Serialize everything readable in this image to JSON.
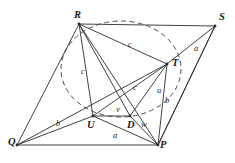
{
  "figure": {
    "type": "geometry-diagram",
    "title": "",
    "stroke_color": "#2b2b2b",
    "dash_color": "#4a4a4a",
    "background": "#ffffff"
  },
  "vertices": [
    {
      "name": "R",
      "label": "R",
      "x": 79,
      "y": 24,
      "lx": 74,
      "ly": 10
    },
    {
      "name": "S",
      "label": "S",
      "x": 215,
      "y": 26,
      "lx": 219,
      "ly": 12
    },
    {
      "name": "T",
      "label": "T",
      "x": 167,
      "y": 64,
      "lx": 172,
      "ly": 58
    },
    {
      "name": "U",
      "label": "U",
      "x": 93,
      "y": 116,
      "lx": 87,
      "ly": 120
    },
    {
      "name": "D",
      "label": "D",
      "x": 130,
      "y": 116,
      "lx": 127,
      "ly": 120
    },
    {
      "name": "Q",
      "label": "Q",
      "x": 17,
      "y": 145,
      "lx": 8,
      "ly": 137
    },
    {
      "name": "P",
      "label": "P",
      "x": 158,
      "y": 145,
      "lx": 160,
      "ly": 140
    }
  ],
  "segments": [
    {
      "name": "R-S",
      "from": "R",
      "to": "S"
    },
    {
      "name": "R-Q",
      "from": "R",
      "to": "Q"
    },
    {
      "name": "Q-P",
      "from": "Q",
      "to": "P"
    },
    {
      "name": "P-S",
      "from": "P",
      "to": "S"
    },
    {
      "name": "R-T",
      "from": "R",
      "to": "T"
    },
    {
      "name": "R-U",
      "from": "R",
      "to": "U"
    },
    {
      "name": "R-D",
      "from": "R",
      "to": "D"
    },
    {
      "name": "R-P",
      "from": "R",
      "to": "P"
    },
    {
      "name": "S-T",
      "from": "S",
      "to": "T"
    },
    {
      "name": "S-P",
      "from": "S",
      "to": "P"
    },
    {
      "name": "T-U",
      "from": "T",
      "to": "U"
    },
    {
      "name": "T-D",
      "from": "T",
      "to": "D"
    },
    {
      "name": "T-P",
      "from": "T",
      "to": "P"
    },
    {
      "name": "U-D",
      "from": "U",
      "to": "D"
    },
    {
      "name": "U-P",
      "from": "U",
      "to": "P"
    },
    {
      "name": "U-Q",
      "from": "U",
      "to": "Q"
    },
    {
      "name": "D-P",
      "from": "D",
      "to": "P"
    },
    {
      "name": "Q-T",
      "from": "Q",
      "to": "T"
    }
  ],
  "segment_labels": [
    {
      "name": "label-c-RT",
      "text": "c",
      "x": 128,
      "y": 40
    },
    {
      "name": "label-a-ST",
      "text": "a",
      "x": 194,
      "y": 44
    },
    {
      "name": "label-c-RU",
      "text": "c",
      "x": 81,
      "y": 67
    },
    {
      "name": "label-c-UT",
      "text": "c",
      "x": 133,
      "y": 83
    },
    {
      "name": "label-u-T",
      "text": "u",
      "x": 157,
      "y": 86
    },
    {
      "name": "label-b-T",
      "text": "b",
      "x": 165,
      "y": 96
    },
    {
      "name": "label-v-UD",
      "text": "v",
      "x": 116,
      "y": 105
    },
    {
      "name": "label-b-QU",
      "text": "b",
      "x": 56,
      "y": 119
    },
    {
      "name": "label-w-DP",
      "text": "w",
      "x": 141,
      "y": 120
    },
    {
      "name": "label-a-UP",
      "text": "a",
      "x": 113,
      "y": 131
    }
  ],
  "circle": {
    "name": "circumscribed-circle",
    "style": "dashed",
    "cx": 121,
    "cy": 69,
    "rx": 60,
    "ry": 48
  }
}
